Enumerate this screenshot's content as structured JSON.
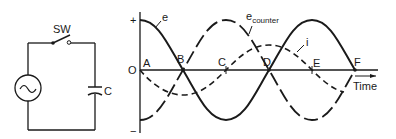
{
  "circuit": {
    "switch_label": "SW",
    "capacitor_label": "C",
    "source_symbol": "~"
  },
  "graph": {
    "y_plus": "+",
    "y_minus": "−",
    "origin": "O",
    "x_axis_label": "Time",
    "points": [
      "A",
      "B",
      "C",
      "D",
      "E",
      "F"
    ],
    "curves": {
      "e": "e",
      "e_counter_base": "e",
      "e_counter_sub": "counter",
      "i": "i"
    }
  },
  "colors": {
    "ink": "#1a1a1a",
    "background": "#ffffff"
  }
}
